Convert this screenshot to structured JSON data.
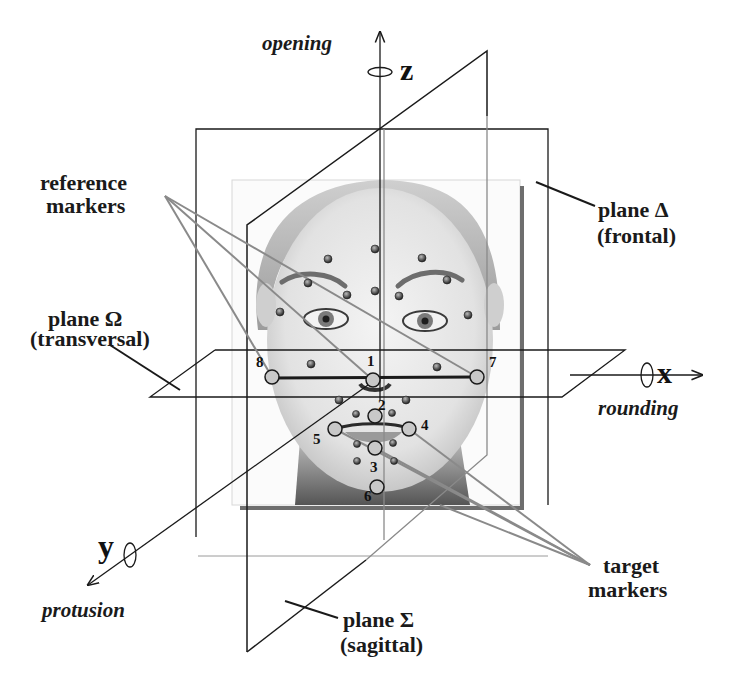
{
  "axes": {
    "z": {
      "label": "z",
      "motion": "opening"
    },
    "x": {
      "label": "x",
      "motion": "rounding"
    },
    "y": {
      "label": "y",
      "motion": "protusion"
    }
  },
  "planes": {
    "frontal": {
      "name": "plane Δ",
      "sub": "(frontal)"
    },
    "transversal": {
      "name": "plane Ω",
      "sub": "(transversal)"
    },
    "sagittal": {
      "name": "plane Σ",
      "sub": "(sagittal)"
    }
  },
  "callouts": {
    "reference": {
      "line1": "reference",
      "line2": "markers"
    },
    "target": {
      "line1": "target",
      "line2": "markers"
    }
  },
  "target_markers": [
    {
      "id": "1",
      "x": 373,
      "y": 380
    },
    {
      "id": "2",
      "x": 375,
      "y": 416
    },
    {
      "id": "3",
      "x": 375,
      "y": 448
    },
    {
      "id": "4",
      "x": 409,
      "y": 429
    },
    {
      "id": "5",
      "x": 335,
      "y": 429
    },
    {
      "id": "6",
      "x": 377,
      "y": 487
    },
    {
      "id": "7",
      "x": 477,
      "y": 377
    },
    {
      "id": "8",
      "x": 272,
      "y": 377
    }
  ],
  "colors": {
    "line": "#1a1a1a",
    "callout_line": "#8a8a8a",
    "marker_fill": "#c8c8c8",
    "frame_shadow": "#6e6e6e"
  }
}
